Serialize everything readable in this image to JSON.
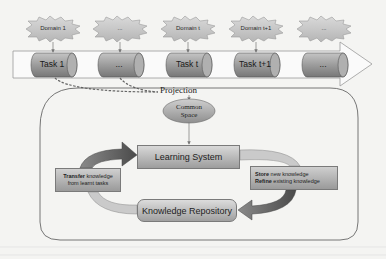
{
  "domains": [
    {
      "label": "Domain 1"
    },
    {
      "label": "..."
    },
    {
      "label": "Domain t"
    },
    {
      "label": "Domain t+1"
    },
    {
      "label": "..."
    }
  ],
  "tasks": [
    {
      "label": "Task 1"
    },
    {
      "label": "..."
    },
    {
      "label": "Task t"
    },
    {
      "label": "Task t+1"
    },
    {
      "label": "..."
    }
  ],
  "projection": {
    "label": "Projection"
  },
  "common_space": {
    "line1": "Common",
    "line2": "Space"
  },
  "learning_system": {
    "label": "Learning System"
  },
  "knowledge_repository": {
    "label": "Knowledge Repository"
  },
  "transfer": {
    "bold": "Transfer",
    "rest": " knowledge",
    "line2": "from learnt tasks"
  },
  "store": {
    "bold1": "Store",
    "rest1": " new knowledge",
    "bold2": "Refine",
    "rest2": " existing knowledge"
  },
  "colors": {
    "background": "#f4f4f2",
    "burst_fill": "#c9c9c9",
    "cylinder_fill": "#9a9a9a",
    "arrow_dark": "#5e5e5e",
    "arrow_light": "#c8c8c8",
    "outline": "#6a6a6a"
  }
}
